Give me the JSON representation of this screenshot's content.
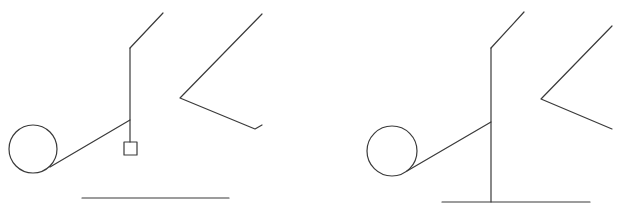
{
  "diagram": {
    "width": 618,
    "height": 215,
    "background": "#ffffff",
    "stroke_color": "#3a3a3a",
    "figures": [
      {
        "name": "left-figure",
        "circle": {
          "cx": 33,
          "cy": 149,
          "r": 24
        },
        "tangent_line": {
          "x1": 50,
          "y1": 167,
          "x2": 130,
          "y2": 120
        },
        "vertical_post": {
          "x1": 130,
          "y1": 48,
          "x2": 130,
          "y2": 142
        },
        "top_diagonal": {
          "x1": 130,
          "y1": 48,
          "x2": 163,
          "y2": 13
        },
        "small_square": {
          "x": 124,
          "y": 142,
          "w": 13,
          "h": 13
        },
        "angle_shape": "262,14 180,98 255,129 262,125",
        "ground_line": {
          "x1": 82,
          "y1": 198,
          "x2": 229,
          "y2": 198
        }
      },
      {
        "name": "right-figure",
        "circle": {
          "cx": 392,
          "cy": 151,
          "r": 25
        },
        "tangent_line": {
          "x1": 407,
          "y1": 171,
          "x2": 491,
          "y2": 122
        },
        "vertical_post": {
          "x1": 491,
          "y1": 48,
          "x2": 491,
          "y2": 202
        },
        "top_diagonal": {
          "x1": 491,
          "y1": 48,
          "x2": 524,
          "y2": 12
        },
        "angle_shape": "612,26 541,99 612,129",
        "ground_line": {
          "x1": 442,
          "y1": 202,
          "x2": 590,
          "y2": 202
        }
      }
    ]
  }
}
